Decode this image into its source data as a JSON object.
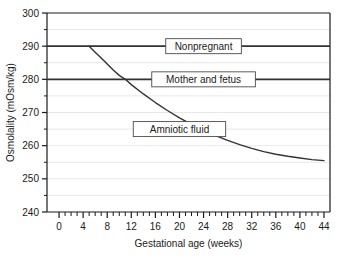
{
  "chart_data": {
    "type": "line",
    "title": "",
    "xlabel": "Gestational age (weeks)",
    "ylabel": "Osmolality (mOsm/kg)",
    "xlim": [
      -2,
      45
    ],
    "ylim": [
      240,
      300
    ],
    "xticks": [
      0,
      4,
      8,
      12,
      16,
      20,
      24,
      28,
      32,
      36,
      40,
      44
    ],
    "xtick_labels": [
      "0",
      "4",
      "8",
      "12",
      "16",
      "20",
      "24",
      "28",
      "32",
      "36",
      "40",
      "44"
    ],
    "x_minor_tick_step": 1,
    "yticks": [
      240,
      250,
      260,
      270,
      280,
      290,
      300
    ],
    "ytick_labels": [
      "240",
      "250",
      "260",
      "270",
      "280",
      "290",
      "300"
    ],
    "y_minor_tick_step": 5,
    "grid": "minor-horizontal-light",
    "legend": "inline-boxed-labels",
    "line_color": "#333333",
    "grid_color": "#e8e8e8",
    "axis_color": "#1a1a1a",
    "series": [
      {
        "name": "Nonpregnant",
        "label": "Nonpregnant",
        "type": "horizontal-line",
        "value": 290,
        "x": [
          -2,
          45
        ],
        "values": [
          290,
          290
        ],
        "label_x": 24,
        "label_y": 290
      },
      {
        "name": "Mother and fetus",
        "label": "Mother and fetus",
        "type": "horizontal-line",
        "value": 280,
        "x": [
          -2,
          45
        ],
        "values": [
          280,
          280
        ],
        "label_x": 24,
        "label_y": 280
      },
      {
        "name": "Amniotic fluid",
        "label": "Amniotic fluid",
        "type": "curve",
        "x": [
          5,
          6,
          7,
          8,
          9,
          10,
          11,
          12,
          14,
          16,
          18,
          20,
          22,
          24,
          26,
          28,
          30,
          32,
          34,
          36,
          38,
          40,
          42,
          44
        ],
        "values": [
          290,
          288.2,
          286.4,
          284.6,
          282.8,
          281.2,
          280,
          278.4,
          275.6,
          273.0,
          270.6,
          268.4,
          266.4,
          264.6,
          263.0,
          261.6,
          260.3,
          259.2,
          258.2,
          257.4,
          256.8,
          256.3,
          255.8,
          255.5
        ],
        "label_x": 20,
        "label_y": 265
      }
    ]
  },
  "axis": {
    "x_title": "Gestational age (weeks)",
    "y_title": "Osmolality (mOsm/kg)"
  }
}
